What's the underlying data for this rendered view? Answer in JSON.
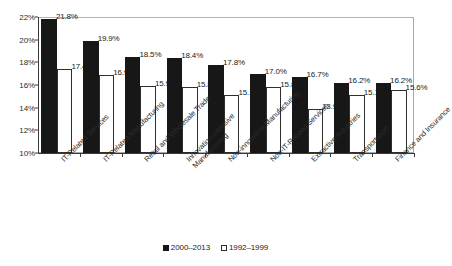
{
  "chart_data": {
    "type": "bar",
    "title": "",
    "xlabel": "",
    "ylabel": "",
    "ylim": [
      10,
      22
    ],
    "ytick_labels": [
      "22%",
      "20%",
      "18%",
      "16%",
      "14%",
      "12%",
      "10%"
    ],
    "ytick_values": [
      22,
      20,
      18,
      16,
      14,
      12,
      10
    ],
    "grid": false,
    "legend_position": "bottom-center",
    "categories": [
      "IT-Related Services",
      "IT-Related Manufacturing",
      "Retail and Wholesale Trade",
      "Innovation-intensive Manufacturing",
      "Non-innovative Manufacturing",
      "Non-IT-Related Services",
      "Extractive Industries",
      "Transportation",
      "Finance and Insurance"
    ],
    "category_lines": [
      [
        "IT-Related Services"
      ],
      [
        "IT-Related Manufacturing"
      ],
      [
        "Retail and Wholesale Trade"
      ],
      [
        "Innovation-intensive",
        "Manufacturing"
      ],
      [
        "Non-innovative Manufacturing"
      ],
      [
        "Non-IT-Related Services"
      ],
      [
        "Extractive Industries"
      ],
      [
        "Transportation"
      ],
      [
        "Finance and Insurance"
      ]
    ],
    "series": [
      {
        "name": "2000–2013",
        "color": "#171717",
        "style": "filled",
        "values": [
          21.8,
          19.9,
          18.5,
          18.4,
          17.8,
          17.0,
          16.7,
          16.2,
          16.2
        ],
        "labels": [
          "21.8%",
          "19.9%",
          "18.5%",
          "18.4%",
          "17.8%",
          "17.0%",
          "16.7%",
          "16.2%",
          "16.2%"
        ]
      },
      {
        "name": "1992–1999",
        "color": "#ffffff",
        "style": "outlined",
        "values": [
          17.4,
          16.9,
          15.9,
          15.8,
          15.1,
          15.8,
          13.9,
          15.1,
          15.6
        ],
        "labels": [
          "17.4%",
          "16.9%",
          "15.9",
          "15.8%",
          "15.1%",
          "15.8%",
          "13.9%",
          "15.1%",
          "15.6%"
        ]
      }
    ]
  },
  "legend": {
    "items": [
      {
        "label": "2000–2013",
        "swatch": "filled-square"
      },
      {
        "label": "1992–1999",
        "swatch": "open-square"
      }
    ]
  }
}
